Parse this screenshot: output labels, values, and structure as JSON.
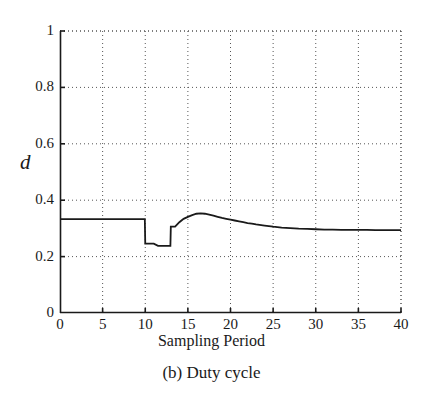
{
  "figure": {
    "caption": "(b) Duty cycle"
  },
  "chart_data": {
    "type": "line",
    "title": "",
    "xlabel": "Sampling Period",
    "ylabel": "d",
    "xlim": [
      0,
      40
    ],
    "ylim": [
      0,
      1
    ],
    "grid": true,
    "legend": null,
    "xticks": [
      0,
      5,
      10,
      15,
      20,
      25,
      30,
      35,
      40
    ],
    "xtick_labels": [
      "0",
      "5",
      "10",
      "15",
      "20",
      "25",
      "30",
      "35",
      "40"
    ],
    "yticks": [
      0,
      0.2,
      0.4,
      0.6,
      0.8,
      1
    ],
    "ytick_labels": [
      "0",
      "0.2",
      "0.4",
      "0.6",
      "0.8",
      "1"
    ],
    "line_color": "#1a1a1a",
    "line_width": 1.8,
    "series": [
      {
        "name": "duty cycle",
        "x": [
          0,
          1,
          2,
          3,
          4,
          5,
          6,
          7,
          8,
          9,
          9.95,
          10.0,
          10.5,
          11.0,
          11.5,
          11.95,
          12.0,
          12.5,
          12.95,
          13.0,
          13.5,
          14.0,
          14.5,
          15.0,
          15.5,
          16.0,
          16.5,
          17.0,
          17.5,
          18.0,
          18.5,
          19.0,
          19.5,
          20.0,
          20.5,
          21.0,
          21.5,
          22.0,
          22.5,
          23.0,
          24.0,
          25.0,
          26.0,
          27.0,
          28.0,
          29.0,
          30.0,
          31.0,
          32.0,
          33.0,
          34.0,
          35.0,
          36.0,
          37.0,
          38.0,
          39.0,
          40.0
        ],
        "y": [
          0.333,
          0.333,
          0.333,
          0.333,
          0.333,
          0.333,
          0.333,
          0.333,
          0.333,
          0.333,
          0.333,
          0.246,
          0.246,
          0.246,
          0.238,
          0.238,
          0.238,
          0.238,
          0.238,
          0.306,
          0.306,
          0.322,
          0.334,
          0.341,
          0.347,
          0.352,
          0.353,
          0.352,
          0.349,
          0.345,
          0.341,
          0.337,
          0.334,
          0.331,
          0.328,
          0.325,
          0.322,
          0.319,
          0.317,
          0.314,
          0.31,
          0.306,
          0.303,
          0.301,
          0.299,
          0.298,
          0.297,
          0.296,
          0.296,
          0.295,
          0.295,
          0.295,
          0.295,
          0.294,
          0.294,
          0.294,
          0.294
        ]
      }
    ]
  }
}
